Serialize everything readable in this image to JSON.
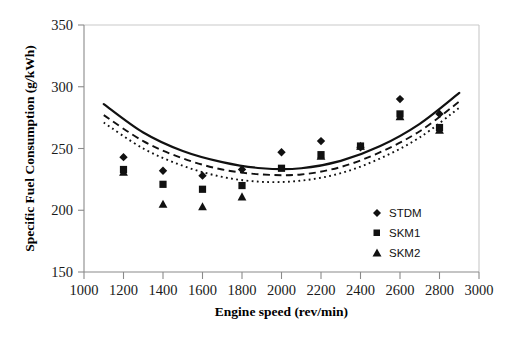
{
  "chart_data": {
    "type": "scatter",
    "title": "",
    "xlabel": "Engine speed (rev/min)",
    "ylabel": "Specific Fuel Consumption (g/kWh)",
    "xlim": [
      1000,
      3000
    ],
    "ylim": [
      150,
      350
    ],
    "xticks": [
      1000,
      1200,
      1400,
      1600,
      1800,
      2000,
      2200,
      2400,
      2600,
      2800,
      3000
    ],
    "yticks": [
      150,
      200,
      250,
      300,
      350
    ],
    "grid": false,
    "legend_position": "inside-lower-right",
    "series": [
      {
        "name": "STDM",
        "marker": "diamond",
        "style": "points",
        "x": [
          1200,
          1400,
          1600,
          1800,
          2000,
          2200,
          2400,
          2600,
          2800
        ],
        "values": [
          243,
          232,
          228,
          233,
          247,
          256,
          251,
          290,
          278
        ]
      },
      {
        "name": "SKM1",
        "marker": "square",
        "style": "points",
        "x": [
          1200,
          1400,
          1600,
          1800,
          2000,
          2200,
          2400,
          2600,
          2800
        ],
        "values": [
          233,
          221,
          217,
          220,
          234,
          245,
          252,
          278,
          267
        ]
      },
      {
        "name": "SKM2",
        "marker": "triangle",
        "style": "points",
        "x": [
          1200,
          1400,
          1600,
          1800,
          2200,
          2400,
          2600,
          2800
        ],
        "values": [
          231,
          205,
          203,
          211,
          244,
          252,
          276,
          265
        ]
      },
      {
        "name": "fit-solid",
        "marker": "none",
        "style": "solid-line",
        "x": [
          1100,
          1300,
          1500,
          1700,
          1900,
          2100,
          2300,
          2500,
          2700,
          2900
        ],
        "values": [
          286,
          263,
          248,
          239,
          234,
          234,
          240,
          252,
          270,
          295
        ]
      },
      {
        "name": "fit-dashed",
        "marker": "none",
        "style": "dashed-line",
        "x": [
          1100,
          1300,
          1500,
          1700,
          1900,
          2100,
          2300,
          2500,
          2700,
          2900
        ],
        "values": [
          277,
          256,
          242,
          233,
          229,
          229,
          235,
          247,
          264,
          288
        ]
      },
      {
        "name": "fit-dotted",
        "marker": "none",
        "style": "dotted-line",
        "x": [
          1100,
          1300,
          1500,
          1700,
          1900,
          2100,
          2300,
          2500,
          2700,
          2900
        ],
        "values": [
          271,
          250,
          236,
          227,
          223,
          224,
          230,
          242,
          259,
          283
        ]
      }
    ]
  },
  "axes": {
    "y_title": "Specific Fuel Consumption (g/kWh)",
    "x_title": "Engine speed (rev/min)",
    "y_tick_labels": [
      "350",
      "300",
      "250",
      "200",
      "150"
    ],
    "x_tick_labels": [
      "1000",
      "1200",
      "1400",
      "1600",
      "1800",
      "2000",
      "2200",
      "2400",
      "2600",
      "2800",
      "3000"
    ]
  },
  "legend": {
    "items": [
      {
        "label": "STDM",
        "marker": "diamond"
      },
      {
        "label": "SKM1",
        "marker": "square"
      },
      {
        "label": "SKM2",
        "marker": "triangle"
      }
    ]
  },
  "colors": {
    "ink": "#111111",
    "axis": "#8a8a8a",
    "frame": "#c9c9c9",
    "background": "#ffffff"
  }
}
